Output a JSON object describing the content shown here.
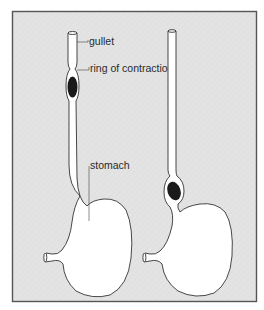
{
  "figure": {
    "panels": [
      {
        "id": "left",
        "state": "bolus in gullet above ring of contraction"
      },
      {
        "id": "right",
        "state": "bolus at entrance to stomach"
      }
    ],
    "labels": {
      "gullet": "gullet",
      "ring": "ring of contraction",
      "stomach": "stomach"
    },
    "colors": {
      "frame_fill": "#e3e3e3",
      "frame_border": "#555555",
      "organ_fill": "#ffffff",
      "outline": "#333333",
      "bolus": "#1a1a1a"
    }
  }
}
